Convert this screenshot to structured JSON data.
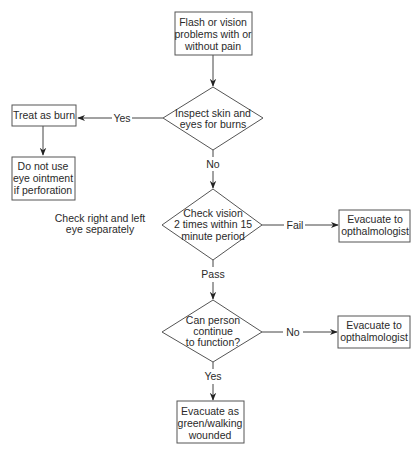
{
  "diagram": {
    "type": "flowchart",
    "nodes": {
      "start": {
        "shape": "rect",
        "lines": [
          "Flash or vision",
          "problems with or",
          "without pain"
        ]
      },
      "inspect": {
        "shape": "diamond",
        "lines": [
          "Inspect skin and",
          "eyes for burns"
        ]
      },
      "treat_burn": {
        "shape": "rect",
        "lines": [
          "Treat as burn"
        ]
      },
      "no_ointment": {
        "shape": "rect",
        "lines": [
          "Do not use",
          "eye ointment",
          "if perforation"
        ]
      },
      "check_vision": {
        "shape": "diamond",
        "lines": [
          "Check vision",
          "2 times within 15",
          "minute period"
        ]
      },
      "evacuate_opth_1": {
        "shape": "rect",
        "lines": [
          "Evacuate to",
          "opthalmologist"
        ]
      },
      "can_function": {
        "shape": "diamond",
        "lines": [
          "Can person",
          "continue",
          "to function?"
        ]
      },
      "evacuate_opth_2": {
        "shape": "rect",
        "lines": [
          "Evacuate to",
          "opthalmologist"
        ]
      },
      "evacuate_green": {
        "shape": "rect",
        "lines": [
          "Evacuate as",
          "green/walking",
          "wounded"
        ]
      }
    },
    "annotation": {
      "lines": [
        "Check right and left",
        "eye separately"
      ]
    },
    "edges": {
      "inspect_yes": "Yes",
      "inspect_no": "No",
      "vision_fail": "Fail",
      "vision_pass": "Pass",
      "function_no": "No",
      "function_yes": "Yes"
    },
    "colors": {
      "stroke": "#555555",
      "text": "#2a2a2a",
      "background": "#ffffff"
    }
  }
}
